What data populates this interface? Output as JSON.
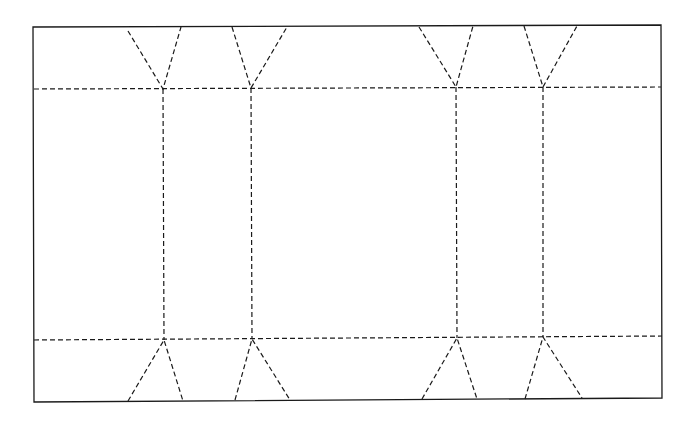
{
  "diagram": {
    "title": "",
    "kind": "box folding template",
    "line_styles": {
      "cut": "solid",
      "fold": "dashed"
    },
    "colors": {
      "background": "#ffffff",
      "ink": "#1a1a1a"
    },
    "elements": {
      "outline": "outer cut outline (rectangle)",
      "horizontal_folds": [
        "top fold line",
        "bottom fold line"
      ],
      "vertical_folds": [
        "fold 1",
        "fold 2",
        "fold 3",
        "fold 4"
      ],
      "top_gussets": [
        "gusset 1",
        "gusset 2",
        "gusset 3",
        "gusset 4"
      ],
      "bottom_gussets": [
        "gusset 1",
        "gusset 2",
        "gusset 3",
        "gusset 4"
      ]
    }
  }
}
